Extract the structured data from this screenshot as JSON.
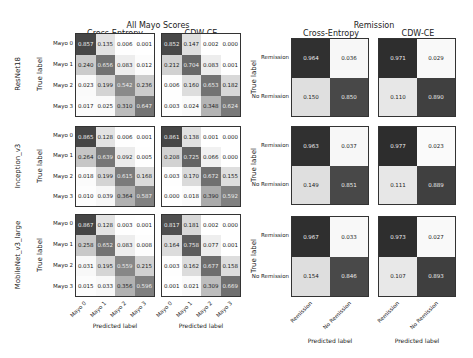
{
  "chart_data": [
    {
      "type": "heatmap",
      "title": "All Mayo Scores",
      "column_titles": [
        "Cross-Entropy",
        "CDW-CE"
      ],
      "row_titles": [
        "ResNet18",
        "Inception_v3",
        "MobileNet_v3_large"
      ],
      "xlabel": "Predicted label",
      "ylabel": "True label",
      "classes": [
        "Mayo 0",
        "Mayo 1",
        "Mayo 2",
        "Mayo 3"
      ],
      "matrices": {
        "ResNet18": {
          "Cross-Entropy": [
            [
              0.857,
              0.135,
              0.006,
              0.001
            ],
            [
              0.24,
              0.656,
              0.083,
              0.012
            ],
            [
              0.023,
              0.199,
              0.542,
              0.236
            ],
            [
              0.017,
              0.025,
              0.31,
              0.647
            ]
          ],
          "CDW-CE": [
            [
              0.852,
              0.147,
              0.002,
              0.0
            ],
            [
              0.212,
              0.704,
              0.083,
              0.001
            ],
            [
              0.006,
              0.16,
              0.653,
              0.182
            ],
            [
              0.003,
              0.024,
              0.348,
              0.624
            ]
          ]
        },
        "Inception_v3": {
          "Cross-Entropy": [
            [
              0.865,
              0.128,
              0.006,
              0.001
            ],
            [
              0.264,
              0.639,
              0.092,
              0.005
            ],
            [
              0.018,
              0.199,
              0.615,
              0.168
            ],
            [
              0.01,
              0.039,
              0.364,
              0.587
            ]
          ],
          "CDW-CE": [
            [
              0.861,
              0.138,
              0.001,
              0.0
            ],
            [
              0.208,
              0.725,
              0.066,
              0.0
            ],
            [
              0.003,
              0.17,
              0.672,
              0.155
            ],
            [
              0.0,
              0.018,
              0.39,
              0.592
            ]
          ]
        },
        "MobileNet_v3_large": {
          "Cross-Entropy": [
            [
              0.867,
              0.128,
              0.003,
              0.001
            ],
            [
              0.258,
              0.652,
              0.083,
              0.008
            ],
            [
              0.031,
              0.195,
              0.559,
              0.215
            ],
            [
              0.015,
              0.033,
              0.356,
              0.596
            ]
          ],
          "CDW-CE": [
            [
              0.817,
              0.181,
              0.002,
              0.0
            ],
            [
              0.164,
              0.758,
              0.077,
              0.001
            ],
            [
              0.003,
              0.162,
              0.677,
              0.158
            ],
            [
              0.001,
              0.021,
              0.309,
              0.669
            ]
          ]
        }
      }
    },
    {
      "type": "heatmap",
      "title": "Remission",
      "column_titles": [
        "Cross-Entropy",
        "CDW-CE"
      ],
      "xlabel": "Predicted label",
      "ylabel": "True label",
      "classes": [
        "Remission",
        "No Remission"
      ],
      "matrices": {
        "ResNet18": {
          "Cross-Entropy": [
            [
              0.964,
              0.036
            ],
            [
              0.15,
              0.85
            ]
          ],
          "CDW-CE": [
            [
              0.971,
              0.029
            ],
            [
              0.11,
              0.89
            ]
          ]
        },
        "Inception_v3": {
          "Cross-Entropy": [
            [
              0.963,
              0.037
            ],
            [
              0.149,
              0.851
            ]
          ],
          "CDW-CE": [
            [
              0.977,
              0.023
            ],
            [
              0.111,
              0.889
            ]
          ]
        },
        "MobileNet_v3_large": {
          "Cross-Entropy": [
            [
              0.967,
              0.033
            ],
            [
              0.154,
              0.846
            ]
          ],
          "CDW-CE": [
            [
              0.973,
              0.027
            ],
            [
              0.107,
              0.893
            ]
          ]
        }
      }
    }
  ]
}
